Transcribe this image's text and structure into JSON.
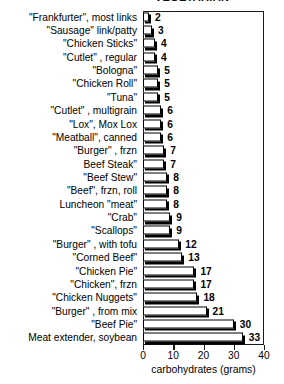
{
  "chart_data": {
    "type": "bar",
    "orientation": "horizontal",
    "title": "VEGETARIAN",
    "xlabel": "carbohydrates (grams)",
    "ylabel": "",
    "xlim": [
      0,
      40
    ],
    "xticks": [
      0,
      10,
      20,
      30,
      40
    ],
    "grid": false,
    "legend": null,
    "categories": [
      "\"Frankfurter\", most links",
      "\"Sausage\" link/patty",
      "\"Chicken Sticks\"",
      "\"Cutlet\" , regular",
      "\"Bologna\"",
      "\"Chicken Roll\"",
      "\"Tuna\"",
      "\"Cutlet\" , multigrain",
      "\"Lox\", Mox Lox",
      "\"Meatball\", canned",
      "\"Burger\" , frzn",
      "Beef Steak\"",
      "\"Beef Stew\"",
      "\"Beef\", frzn, roll",
      "Luncheon \"meat\"",
      "\"Crab\"",
      "\"Scallops\"",
      "\"Burger\" , with tofu",
      "\"Corned Beef\"",
      "\"Chicken Pie\"",
      "\"Chicken\", frzn",
      "\"Chicken Nuggets\"",
      "\"Burger\" , from mix",
      "\"Beef Pie\"",
      "Meat extender, soybean"
    ],
    "values": [
      2,
      3,
      4,
      4,
      5,
      5,
      5,
      6,
      6,
      6,
      7,
      7,
      8,
      8,
      8,
      9,
      9,
      12,
      13,
      17,
      17,
      18,
      21,
      30,
      33
    ]
  }
}
